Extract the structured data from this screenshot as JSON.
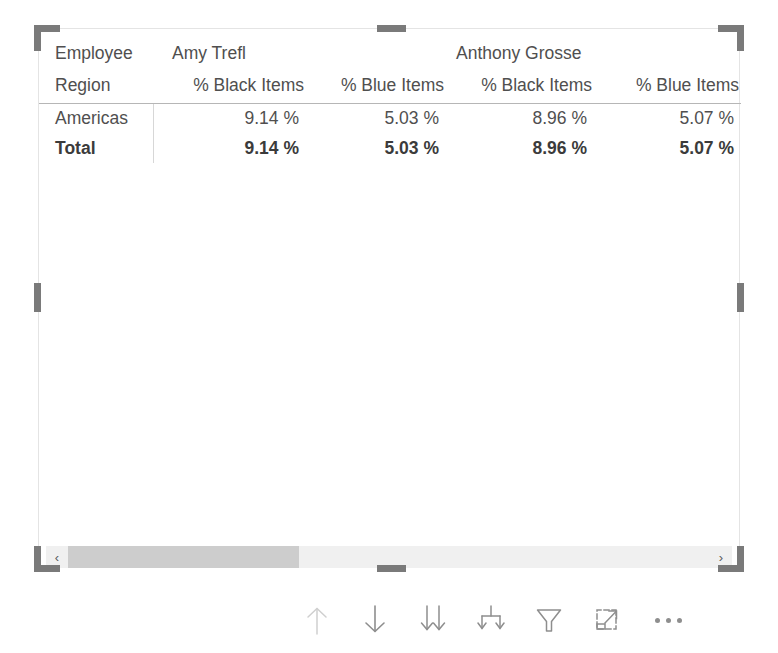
{
  "visual": {
    "type": "matrix",
    "row_header_label_top": "Employee",
    "row_header_label_bottom": "Region",
    "column_groups": [
      {
        "name": "Amy Trefl"
      },
      {
        "name": "Anthony Grosse"
      }
    ],
    "measure_headers": [
      "% Black Items",
      "% Blue Items",
      "% Black Items",
      "% Blue Items"
    ],
    "rows": [
      {
        "label": "Americas",
        "is_total": false,
        "values": [
          "9.14 %",
          "5.03 %",
          "8.96 %",
          "5.07 %"
        ]
      },
      {
        "label": "Total",
        "is_total": true,
        "values": [
          "9.14 %",
          "5.03 %",
          "8.96 %",
          "5.07 %"
        ]
      }
    ]
  },
  "scrollbar": {
    "left_arrow": "‹",
    "right_arrow": "›",
    "thumb_position_percent": 0,
    "thumb_width_percent": 36
  },
  "toolbar": {
    "buttons": [
      {
        "icon": "drill-up-arrow-icon",
        "label": "Drill up",
        "disabled": true
      },
      {
        "icon": "drill-down-arrow-icon",
        "label": "Click to turn on Drill Down",
        "disabled": false
      },
      {
        "icon": "expand-next-level-icon",
        "label": "Go to the next level in the hierarchy",
        "disabled": false
      },
      {
        "icon": "expand-all-down-icon",
        "label": "Expand all down one level in the hierarchy",
        "disabled": false
      },
      {
        "icon": "filter-funnel-icon",
        "label": "Filters and slicers affecting this visual",
        "disabled": false
      },
      {
        "icon": "focus-mode-icon",
        "label": "Focus mode",
        "disabled": false
      },
      {
        "icon": "more-options-ellipsis-icon",
        "label": "More options",
        "disabled": false
      }
    ]
  },
  "colors": {
    "handle": "#7a7a7a",
    "text": "#504f4f",
    "total_text": "#3b3b3b",
    "rule": "#b6b6b6",
    "divider": "#d7d7d7",
    "scroll_track": "#f0f0f0",
    "scroll_thumb": "#cdcdcd",
    "icon": "#8e8e8e",
    "icon_disabled": "#c9c9c9",
    "container_border": "#e4e4e4"
  },
  "selection": {
    "selected": true,
    "handle_count": 8
  }
}
